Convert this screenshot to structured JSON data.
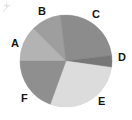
{
  "chart_data": {
    "type": "pie",
    "title": "",
    "subtitle": "",
    "xlabel": "",
    "ylabel": "",
    "grid": false,
    "legend": "none",
    "labels_position": "outside",
    "center": {
      "x": 66,
      "y": 61
    },
    "radius": 46,
    "start_angle_deg": 180,
    "direction": "clockwise",
    "categories": [
      "A",
      "B",
      "C",
      "D",
      "E",
      "F"
    ],
    "values": [
      12.5,
      10.5,
      25.0,
      4.0,
      28.5,
      19.5
    ],
    "percent_labels": [
      "12.5%",
      "10.5%",
      "25.0%",
      "4.0%",
      "28.5%",
      "19.5%"
    ],
    "colors": [
      "#b3b3b3",
      "#9e9e9e",
      "#8c8c8c",
      "#777777",
      "#dcdcdc",
      "#8f8f8f"
    ],
    "slices": [
      {
        "name": "A",
        "label": "A",
        "value": 12.5,
        "color": "#b3b3b3",
        "start_deg": 180,
        "end_deg": 135,
        "label_x": 11,
        "label_y": 38
      },
      {
        "name": "B",
        "label": "B",
        "value": 10.5,
        "color": "#9e9e9e",
        "start_deg": 135,
        "end_deg": 97,
        "label_x": 38,
        "label_y": 6
      },
      {
        "name": "C",
        "label": "C",
        "value": 25.0,
        "color": "#8c8c8c",
        "start_deg": 97,
        "end_deg": 7,
        "label_x": 92,
        "label_y": 9
      },
      {
        "name": "D",
        "label": "D",
        "value": 4.0,
        "color": "#777777",
        "start_deg": 7,
        "end_deg": -8,
        "label_x": 118,
        "label_y": 52
      },
      {
        "name": "E",
        "label": "E",
        "value": 28.5,
        "color": "#dcdcdc",
        "start_deg": -8,
        "end_deg": -110,
        "label_x": 98,
        "label_y": 96
      },
      {
        "name": "F",
        "label": "F",
        "value": 19.5,
        "color": "#8f8f8f",
        "start_deg": -110,
        "end_deg": -180,
        "label_x": 21,
        "label_y": 93
      }
    ],
    "background_color": "#ffffff",
    "outline_color": "#c9c9c9"
  },
  "corner": {
    "mark_name": "faint-corner-mark"
  }
}
